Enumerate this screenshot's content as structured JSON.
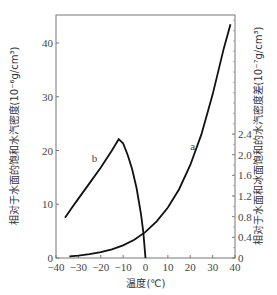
{
  "chart_data": {
    "type": "line",
    "title": "",
    "xlabel": "温度(℃)",
    "ylabel_left": "相对于水面的饱和水汽密度(10⁻⁶g/cm³)",
    "ylabel_right": "相对于水面和冰面饱和的水汽密度差(10⁻⁷g/cm³)",
    "xlim": [
      -40,
      40
    ],
    "ylim_left": [
      0,
      46
    ],
    "ylim_right": [
      0,
      2.4
    ],
    "x_ticks": [
      "-40",
      "-30",
      "-20",
      "-10",
      "0",
      "10",
      "20",
      "30",
      "40"
    ],
    "y_left_ticks": [
      "0",
      "10",
      "20",
      "30",
      "40"
    ],
    "y_right_ticks": [
      "0",
      "0.4",
      "0.8",
      "1.2",
      "1.6",
      "2.0",
      "2.4"
    ],
    "grid": false,
    "series": [
      {
        "name": "a",
        "axis": "left",
        "x": [
          -34,
          -30,
          -25,
          -20,
          -15,
          -10,
          -5,
          0,
          5,
          10,
          15,
          20,
          25,
          30,
          35,
          38
        ],
        "y": [
          0.3,
          0.45,
          0.7,
          1.07,
          1.6,
          2.36,
          3.4,
          4.85,
          6.8,
          9.4,
          12.8,
          17.3,
          23.0,
          30.4,
          39.0,
          43.5
        ]
      },
      {
        "name": "b",
        "axis": "right",
        "x": [
          -36,
          -33,
          -30,
          -25,
          -20,
          -15,
          -12,
          -10,
          -8,
          -6,
          -4,
          -2,
          -1,
          0
        ],
        "y": [
          0.78,
          0.97,
          1.15,
          1.45,
          1.75,
          2.08,
          2.3,
          2.22,
          2.0,
          1.72,
          1.35,
          0.85,
          0.5,
          0.0
        ]
      }
    ],
    "annotations": [
      {
        "text": "a",
        "x": 20,
        "y_right": 2.1
      },
      {
        "text": "b",
        "x": -24,
        "y_right": 1.85
      }
    ]
  }
}
